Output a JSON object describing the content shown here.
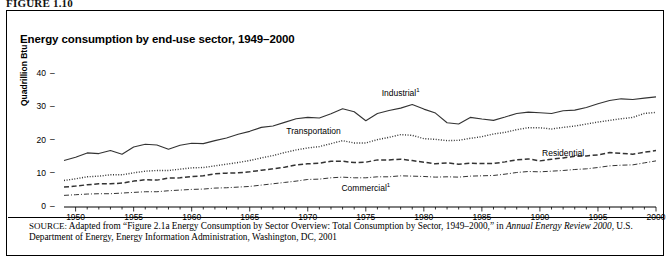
{
  "figure": {
    "label": "FIGURE 1.10"
  },
  "chart_title": "Energy consumption by end-use sector, 1949–2000",
  "axes": {
    "ylabel": "Quadrillion Btu",
    "yticks": [
      "0",
      "10",
      "20",
      "30",
      "40"
    ],
    "ytick_dash": "–",
    "ylim": [
      0,
      44
    ],
    "xticks": [
      "1950",
      "1955",
      "1960",
      "1965",
      "1970",
      "1975",
      "1980",
      "1985",
      "1990",
      "1995",
      "2000"
    ],
    "xlim": [
      1949,
      2000
    ]
  },
  "series_labels": {
    "industrial": "Industrial",
    "industrial_footnote": "1",
    "transportation": "Transportation",
    "residential": "Residential",
    "commercial": "Commercial",
    "commercial_footnote": "1"
  },
  "source": {
    "prefix": "SOURCE:",
    "text_before_italic": " Adapted from “Figure 2.1a Energy Consumption by Sector Overview: Total Consumption by Sector, 1949–2000,” in ",
    "italic_title": "Annual Energy Review 2000",
    "text_after_italic": ", U.S. Department of Energy, Energy Information Administration, Washington, DC, 2001"
  },
  "colors": {
    "line": "#333333",
    "axis": "#000000",
    "background": "#ffffff"
  },
  "chart_data": {
    "type": "line",
    "title": "Energy consumption by end-use sector, 1949–2000",
    "xlabel": "",
    "ylabel": "Quadrillion Btu",
    "ylim": [
      0,
      44
    ],
    "xlim": [
      1949,
      2000
    ],
    "grid": false,
    "legend": "inline-labels",
    "x": [
      1949,
      1950,
      1951,
      1952,
      1953,
      1954,
      1955,
      1956,
      1957,
      1958,
      1959,
      1960,
      1961,
      1962,
      1963,
      1964,
      1965,
      1966,
      1967,
      1968,
      1969,
      1970,
      1971,
      1972,
      1973,
      1974,
      1975,
      1976,
      1977,
      1978,
      1979,
      1980,
      1981,
      1982,
      1983,
      1984,
      1985,
      1986,
      1987,
      1988,
      1989,
      1990,
      1991,
      1992,
      1993,
      1994,
      1995,
      1996,
      1997,
      1998,
      1999,
      2000
    ],
    "series": [
      {
        "name": "Industrial",
        "style": "solid",
        "values": [
          14.0,
          15.0,
          16.3,
          16.1,
          17.0,
          15.9,
          18.1,
          18.9,
          18.7,
          17.4,
          18.6,
          19.2,
          19.1,
          20.0,
          20.8,
          21.9,
          22.8,
          24.0,
          24.4,
          25.5,
          26.6,
          27.0,
          26.8,
          28.1,
          29.6,
          28.7,
          26.0,
          28.2,
          29.1,
          29.8,
          30.9,
          29.5,
          28.3,
          25.4,
          25.0,
          27.0,
          26.5,
          26.1,
          27.1,
          28.2,
          28.6,
          28.4,
          28.2,
          29.0,
          29.2,
          30.0,
          31.1,
          32.1,
          32.6,
          32.4,
          32.8,
          33.2
        ]
      },
      {
        "name": "Transportation",
        "style": "dotted",
        "values": [
          8.0,
          8.5,
          9.1,
          9.3,
          9.7,
          9.7,
          10.3,
          10.8,
          11.0,
          11.0,
          11.4,
          11.8,
          11.9,
          12.4,
          12.9,
          13.4,
          14.0,
          14.8,
          15.5,
          16.4,
          17.2,
          17.8,
          18.2,
          19.1,
          20.0,
          19.3,
          19.3,
          20.3,
          21.0,
          21.8,
          21.6,
          20.6,
          20.4,
          20.0,
          20.1,
          20.7,
          21.2,
          22.0,
          22.5,
          23.3,
          23.9,
          23.9,
          23.5,
          24.0,
          24.4,
          25.0,
          25.6,
          26.1,
          26.6,
          27.0,
          28.2,
          28.5
        ]
      },
      {
        "name": "Residential",
        "style": "dashed",
        "values": [
          6.0,
          6.3,
          6.7,
          7.0,
          7.0,
          7.2,
          7.8,
          8.2,
          8.1,
          8.7,
          8.8,
          9.2,
          9.4,
          10.0,
          10.2,
          10.3,
          10.6,
          11.1,
          11.5,
          12.0,
          12.7,
          13.0,
          13.2,
          13.8,
          13.8,
          13.4,
          13.5,
          14.2,
          14.2,
          14.4,
          14.0,
          13.5,
          13.0,
          13.3,
          12.9,
          13.2,
          13.1,
          13.1,
          13.6,
          14.2,
          14.5,
          13.9,
          14.4,
          14.8,
          15.3,
          15.4,
          15.7,
          16.4,
          16.2,
          15.9,
          16.5,
          17.0
        ]
      },
      {
        "name": "Commercial",
        "style": "dashdot",
        "values": [
          3.5,
          3.7,
          3.9,
          4.0,
          4.0,
          4.2,
          4.4,
          4.6,
          4.6,
          4.9,
          5.1,
          5.3,
          5.4,
          5.7,
          5.8,
          6.0,
          6.2,
          6.6,
          7.0,
          7.4,
          7.8,
          8.3,
          8.4,
          8.8,
          9.0,
          8.8,
          8.8,
          9.1,
          9.1,
          9.4,
          9.3,
          9.2,
          9.0,
          9.1,
          9.0,
          9.3,
          9.4,
          9.5,
          9.9,
          10.4,
          10.7,
          10.6,
          10.8,
          11.0,
          11.3,
          11.5,
          11.9,
          12.4,
          12.6,
          12.7,
          13.3,
          13.9
        ]
      }
    ]
  }
}
